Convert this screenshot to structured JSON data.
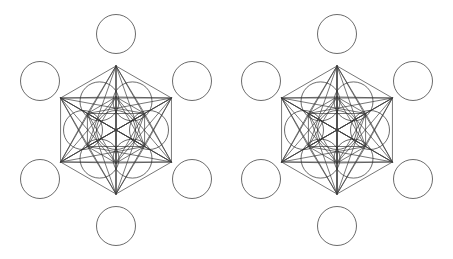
{
  "page": {
    "background_color": "#ffffff",
    "width": 453,
    "height": 259
  },
  "style": {
    "stroke_color": "#3c3c3c",
    "stroke_color_dark": "#2b2b2b",
    "stroke_width": 0.7,
    "circle_stroke_width": 0.7,
    "fill": "none"
  },
  "figures": [
    {
      "id": "metatron-left",
      "name": "Metatron's Cube (left variant)",
      "label": "Left figure",
      "origin_x": 0,
      "origin_y": 0,
      "width": 226,
      "height": 259,
      "center": {
        "cx": 116,
        "cy": 130
      },
      "outer_ring_radius": 64,
      "inner_ring_radius": 33,
      "circle_radius": 19.5,
      "has_vertical_axis": false,
      "circle_count": 13,
      "circles": [
        {
          "name": "center",
          "cx": 116,
          "cy": 130,
          "r": 19.5
        },
        {
          "name": "inner-top-right",
          "cx": 132.5,
          "cy": 101.4,
          "r": 19.5
        },
        {
          "name": "inner-right",
          "cx": 149,
          "cy": 130,
          "r": 19.5
        },
        {
          "name": "inner-bottom-right",
          "cx": 132.5,
          "cy": 158.6,
          "r": 19.5
        },
        {
          "name": "inner-bottom-left",
          "cx": 99.5,
          "cy": 158.6,
          "r": 19.5
        },
        {
          "name": "inner-left",
          "cx": 83,
          "cy": 130,
          "r": 19.5
        },
        {
          "name": "inner-top-left",
          "cx": 99.5,
          "cy": 101.4,
          "r": 19.5
        },
        {
          "name": "outer-top",
          "cx": 116,
          "cy": 34,
          "r": 19.5
        },
        {
          "name": "outer-top-right",
          "cx": 192,
          "cy": 81,
          "r": 19.5
        },
        {
          "name": "outer-bottom-right",
          "cx": 192,
          "cy": 179,
          "r": 19.5
        },
        {
          "name": "outer-bottom",
          "cx": 116,
          "cy": 226,
          "r": 19.5
        },
        {
          "name": "outer-bottom-left",
          "cx": 40,
          "cy": 179,
          "r": 19.5
        },
        {
          "name": "outer-top-left",
          "cx": 40,
          "cy": 81,
          "r": 19.5
        }
      ]
    },
    {
      "id": "metatron-right",
      "name": "Metatron's Cube (right variant, with vertical axis)",
      "label": "Right figure",
      "origin_x": 227,
      "origin_y": 0,
      "width": 226,
      "height": 259,
      "center": {
        "cx": 110,
        "cy": 130
      },
      "outer_ring_radius": 64,
      "inner_ring_radius": 33,
      "circle_radius": 19.5,
      "has_vertical_axis": true,
      "circle_count": 13,
      "circles": [
        {
          "name": "center",
          "cx": 110,
          "cy": 130,
          "r": 19.5
        },
        {
          "name": "inner-top-right",
          "cx": 126.5,
          "cy": 101.4,
          "r": 19.5
        },
        {
          "name": "inner-right",
          "cx": 143,
          "cy": 130,
          "r": 19.5
        },
        {
          "name": "inner-bottom-right",
          "cx": 126.5,
          "cy": 158.6,
          "r": 19.5
        },
        {
          "name": "inner-bottom-left",
          "cx": 93.5,
          "cy": 158.6,
          "r": 19.5
        },
        {
          "name": "inner-left",
          "cx": 77,
          "cy": 130,
          "r": 19.5
        },
        {
          "name": "inner-top-left",
          "cx": 93.5,
          "cy": 101.4,
          "r": 19.5
        },
        {
          "name": "outer-top",
          "cx": 110,
          "cy": 34,
          "r": 19.5
        },
        {
          "name": "outer-top-right",
          "cx": 186,
          "cy": 81,
          "r": 19.5
        },
        {
          "name": "outer-bottom-right",
          "cx": 186,
          "cy": 179,
          "r": 19.5
        },
        {
          "name": "outer-bottom",
          "cx": 110,
          "cy": 226,
          "r": 19.5
        },
        {
          "name": "outer-bottom-left",
          "cx": 34,
          "cy": 179,
          "r": 19.5
        },
        {
          "name": "outer-top-left",
          "cx": 34,
          "cy": 81,
          "r": 19.5
        }
      ]
    }
  ]
}
